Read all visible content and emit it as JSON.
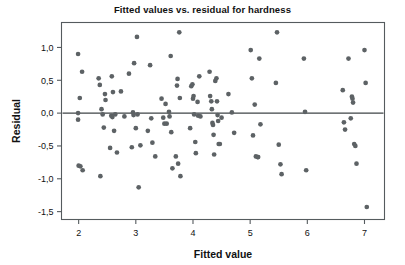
{
  "chart_data": {
    "type": "scatter",
    "title": "Fitted values vs. residual for hardness",
    "xlabel": "Fitted value",
    "ylabel": "Residual",
    "xlim": [
      1.7,
      7.35
    ],
    "ylim": [
      -1.62,
      1.38
    ],
    "xticks": [
      2,
      3,
      4,
      5,
      6,
      7
    ],
    "xticklabels": [
      "2",
      "3",
      "4",
      "5",
      "6",
      "7"
    ],
    "yticks": [
      1.0,
      0.5,
      0.0,
      -0.5,
      -1.0,
      -1.5
    ],
    "yticklabels": [
      "1,0",
      "0,5",
      "0,0",
      "-0,5",
      "-1,0",
      "-1,5"
    ],
    "grid": false,
    "legend": false,
    "decimal_separator": ",",
    "reference_line": {
      "orientation": "horizontal",
      "y": 0.0
    },
    "marker_color": "#5d6265",
    "frame_color": "#555b5e",
    "points": [
      [
        1.99,
        0.9
      ],
      [
        1.99,
        0.0
      ],
      [
        1.99,
        -0.1
      ],
      [
        2.0,
        -0.8
      ],
      [
        2.03,
        -0.81
      ],
      [
        2.06,
        0.63
      ],
      [
        2.07,
        -0.87
      ],
      [
        2.02,
        0.23
      ],
      [
        2.35,
        0.53
      ],
      [
        2.37,
        0.43
      ],
      [
        2.38,
        -0.96
      ],
      [
        2.4,
        0.06
      ],
      [
        2.42,
        -0.02
      ],
      [
        2.44,
        -0.22
      ],
      [
        2.46,
        0.29
      ],
      [
        2.47,
        0.2
      ],
      [
        2.55,
        -0.53
      ],
      [
        2.57,
        -0.04
      ],
      [
        2.58,
        0.56
      ],
      [
        2.59,
        -0.06
      ],
      [
        2.6,
        0.32
      ],
      [
        2.62,
        -0.27
      ],
      [
        2.64,
        -0.02
      ],
      [
        2.67,
        -0.6
      ],
      [
        2.74,
        0.33
      ],
      [
        2.8,
        -0.05
      ],
      [
        2.88,
        0.6
      ],
      [
        2.93,
        -0.52
      ],
      [
        2.95,
        0.01
      ],
      [
        2.96,
        -0.03
      ],
      [
        2.97,
        0.76
      ],
      [
        3.0,
        -0.23
      ],
      [
        3.02,
        1.16
      ],
      [
        3.03,
        -0.02
      ],
      [
        3.05,
        -1.13
      ],
      [
        3.08,
        -0.49
      ],
      [
        3.21,
        -0.27
      ],
      [
        3.25,
        0.73
      ],
      [
        3.27,
        -0.08
      ],
      [
        3.29,
        -0.45
      ],
      [
        3.34,
        -0.66
      ],
      [
        3.45,
        0.22
      ],
      [
        3.48,
        -0.07
      ],
      [
        3.5,
        -0.16
      ],
      [
        3.52,
        0.14
      ],
      [
        3.54,
        -0.16
      ],
      [
        3.58,
        0.02
      ],
      [
        3.59,
        -0.05
      ],
      [
        3.61,
        0.87
      ],
      [
        3.62,
        -0.29
      ],
      [
        3.64,
        -0.84
      ],
      [
        3.7,
        -0.66
      ],
      [
        3.72,
        0.42
      ],
      [
        3.73,
        0.52
      ],
      [
        3.74,
        -0.77
      ],
      [
        3.76,
        1.23
      ],
      [
        3.77,
        0.23
      ],
      [
        3.78,
        -0.96
      ],
      [
        3.95,
        -0.23
      ],
      [
        3.97,
        0.41
      ],
      [
        3.99,
        0.44
      ],
      [
        4.0,
        0.22
      ],
      [
        4.01,
        0.26
      ],
      [
        4.02,
        -0.02
      ],
      [
        4.04,
        -0.44
      ],
      [
        4.05,
        -0.61
      ],
      [
        4.08,
        0.17
      ],
      [
        4.09,
        -0.04
      ],
      [
        4.11,
        0.56
      ],
      [
        4.13,
        -0.05
      ],
      [
        4.29,
        0.63
      ],
      [
        4.3,
        0.26
      ],
      [
        4.32,
        0.18
      ],
      [
        4.33,
        0.06
      ],
      [
        4.34,
        -0.15
      ],
      [
        4.35,
        -0.18
      ],
      [
        4.36,
        -0.33
      ],
      [
        4.37,
        -0.63
      ],
      [
        4.39,
        0.49
      ],
      [
        4.41,
        0.53
      ],
      [
        4.42,
        0.18
      ],
      [
        4.43,
        -0.03
      ],
      [
        4.44,
        -0.12
      ],
      [
        4.45,
        -0.47
      ],
      [
        4.47,
        -0.47
      ],
      [
        4.5,
        -0.07
      ],
      [
        4.62,
        0.29
      ],
      [
        4.68,
        0.01
      ],
      [
        4.72,
        -0.3
      ],
      [
        5.01,
        0.96
      ],
      [
        5.03,
        0.53
      ],
      [
        5.05,
        -0.34
      ],
      [
        5.08,
        0.13
      ],
      [
        5.1,
        -0.66
      ],
      [
        5.13,
        -0.67
      ],
      [
        5.14,
        -0.67
      ],
      [
        5.16,
        0.83
      ],
      [
        5.18,
        -0.17
      ],
      [
        5.45,
        0.46
      ],
      [
        5.47,
        1.23
      ],
      [
        5.5,
        -0.48
      ],
      [
        5.53,
        -0.78
      ],
      [
        5.55,
        -0.93
      ],
      [
        5.94,
        0.83
      ],
      [
        5.96,
        0.02
      ],
      [
        5.98,
        -0.87
      ],
      [
        6.62,
        0.35
      ],
      [
        6.64,
        -0.14
      ],
      [
        6.66,
        -0.25
      ],
      [
        6.72,
        0.83
      ],
      [
        6.76,
        -0.08
      ],
      [
        6.78,
        0.25
      ],
      [
        6.79,
        0.22
      ],
      [
        6.8,
        0.16
      ],
      [
        6.82,
        -0.47
      ],
      [
        6.84,
        -0.5
      ],
      [
        6.86,
        -0.77
      ],
      [
        7.0,
        0.96
      ],
      [
        7.02,
        0.46
      ],
      [
        7.04,
        -1.43
      ]
    ]
  }
}
